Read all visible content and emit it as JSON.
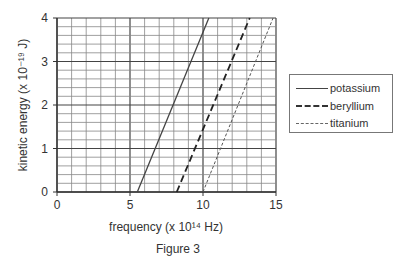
{
  "chart_data": {
    "type": "line",
    "title": "",
    "caption": "Figure 3",
    "xlabel": "frequency (x 10¹⁴ Hz)",
    "ylabel": "kinetic energy (x 10⁻¹⁹ J)",
    "xlim": [
      0,
      15
    ],
    "ylim": [
      0,
      4
    ],
    "xticks": [
      0,
      5,
      10,
      15
    ],
    "yticks": [
      0,
      1,
      2,
      3,
      4
    ],
    "grid": true,
    "legend_position": "right",
    "series": [
      {
        "name": "potassium",
        "style": "solid",
        "x": [
          5.5,
          10.4
        ],
        "y": [
          0,
          4
        ]
      },
      {
        "name": "beryllium",
        "style": "dashed",
        "x": [
          8.2,
          13.2
        ],
        "y": [
          0,
          4
        ]
      },
      {
        "name": "titanium",
        "style": "dotted",
        "x": [
          10.0,
          14.8
        ],
        "y": [
          0,
          4
        ]
      }
    ]
  }
}
